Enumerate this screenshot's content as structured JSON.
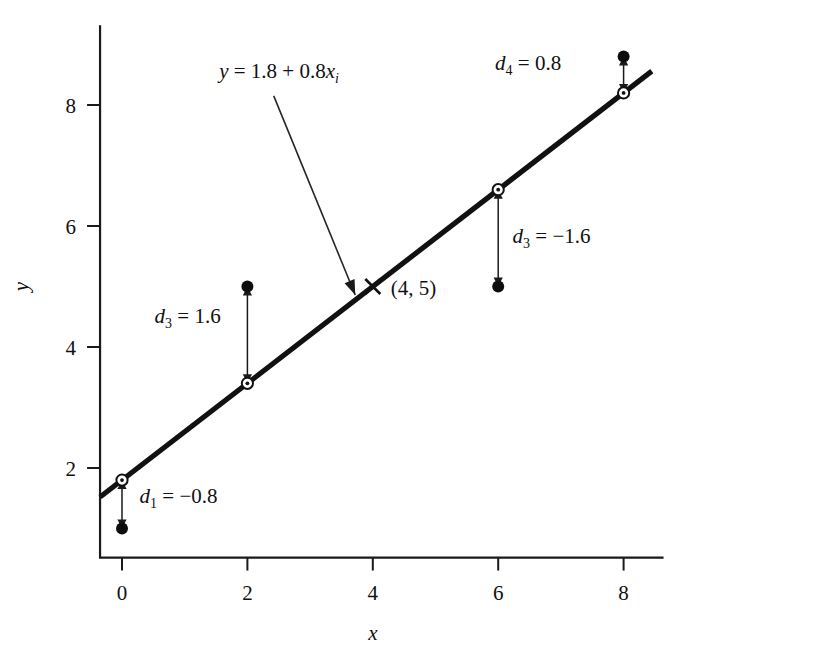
{
  "chart_data": {
    "type": "scatter",
    "title": "",
    "subtitle": "",
    "xlabel": "x",
    "ylabel": "y",
    "xlim": [
      -0.6,
      8.6
    ],
    "ylim": [
      0.35,
      9.35
    ],
    "xticks": [
      0,
      2,
      4,
      6,
      8
    ],
    "xtick_labels": [
      "0",
      "2",
      "4",
      "6",
      "8"
    ],
    "yticks": [
      2,
      4,
      6,
      8
    ],
    "ytick_labels": [
      "2",
      "4",
      "6",
      "8"
    ],
    "grid": false,
    "legend": "none",
    "fit_line": {
      "equation_label": "y = 1.8 + 0.8x",
      "equation_label_subscript": "i",
      "intercept": 1.8,
      "slope": 0.8,
      "x_start": -0.35,
      "x_end": 8.45
    },
    "observed_points": {
      "name": "Observed data",
      "marker": "filled-circle",
      "x": [
        0,
        2,
        6,
        8
      ],
      "y": [
        1.0,
        5.0,
        5.0,
        8.8
      ]
    },
    "fitted_points": {
      "name": "Fitted values on line",
      "marker": "open-circle",
      "x": [
        0,
        2,
        6,
        8
      ],
      "y": [
        1.8,
        3.4,
        6.6,
        8.2
      ]
    },
    "highlight_point": {
      "marker": "x-cross",
      "x": 4,
      "y": 5,
      "label": "(4, 5)"
    },
    "residuals": [
      {
        "id": "d1",
        "label_base": "d",
        "label_subscript": "1",
        "label_value": "= −0.8",
        "full_label": "d₁ = −0.8",
        "value": -0.8,
        "x": 0,
        "y_from": 1.8,
        "y_to": 1.0,
        "text_x": 0.28,
        "text_y": 1.42
      },
      {
        "id": "d2",
        "label_base": "d",
        "label_subscript": "3",
        "label_value": "= 1.6",
        "full_label": "d₃ = 1.6",
        "value": 1.6,
        "x": 2,
        "y_from": 3.4,
        "y_to": 5.0,
        "text_x": 0.52,
        "text_y": 4.4
      },
      {
        "id": "d3",
        "label_base": "d",
        "label_subscript": "3",
        "label_value": "= −1.6",
        "full_label": "d₃ = −1.6",
        "value": -1.6,
        "x": 6,
        "y_from": 6.6,
        "y_to": 5.0,
        "text_x": 6.23,
        "text_y": 5.72
      },
      {
        "id": "d4",
        "label_base": "d",
        "label_subscript": "4",
        "label_value": "= 0.8",
        "full_label": "d₄ = 0.8",
        "value": 0.8,
        "x": 8,
        "y_from": 8.2,
        "y_to": 8.8,
        "text_x": 5.95,
        "text_y": 8.58
      }
    ],
    "equation_annotation": {
      "text_x": 1.55,
      "text_y": 8.45,
      "arrow_from_x": 2.42,
      "arrow_from_y": 8.15,
      "arrow_to_x": 3.72,
      "arrow_to_y": 4.86
    },
    "colors": {
      "ink": "#111111",
      "background": "#ffffff",
      "line": "#111111"
    }
  },
  "axis": {
    "x_label": "x",
    "y_label": "y"
  }
}
